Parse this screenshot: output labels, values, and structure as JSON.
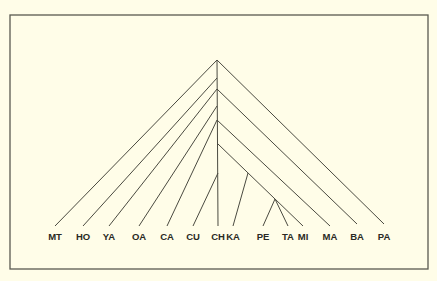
{
  "colors": {
    "background": "#fffde8",
    "line": "#4a4a40",
    "frame": "#5a5a50",
    "text": "#2a2a24"
  },
  "frame": {
    "x": 10,
    "y": 15,
    "width": 418,
    "height": 254
  },
  "tree": {
    "root": {
      "x": 217,
      "y": 60
    },
    "leaves": [
      {
        "id": "MT",
        "label": "MT",
        "x": 55,
        "y": 226
      },
      {
        "id": "HO",
        "label": "HO",
        "x": 83,
        "y": 226
      },
      {
        "id": "YA",
        "label": "YA",
        "x": 109,
        "y": 226
      },
      {
        "id": "OA",
        "label": "OA",
        "x": 139,
        "y": 226
      },
      {
        "id": "CA",
        "label": "CA",
        "x": 167,
        "y": 226
      },
      {
        "id": "CU",
        "label": "CU",
        "x": 193,
        "y": 226
      },
      {
        "id": "CH",
        "label": "CH",
        "x": 218,
        "y": 226
      },
      {
        "id": "KA",
        "label": "KA",
        "x": 233,
        "y": 226
      },
      {
        "id": "PE",
        "label": "PE",
        "x": 263,
        "y": 226
      },
      {
        "id": "TA",
        "label": "TA",
        "x": 288,
        "y": 226
      },
      {
        "id": "MI",
        "label": "MI",
        "x": 303,
        "y": 226
      },
      {
        "id": "MA",
        "label": "MA",
        "x": 330,
        "y": 226
      },
      {
        "id": "BA",
        "label": "BA",
        "x": 357,
        "y": 224
      },
      {
        "id": "PA",
        "label": "PA",
        "x": 384,
        "y": 224
      }
    ],
    "edges": [
      {
        "x1": 217,
        "y1": 60,
        "x2": 55,
        "y2": 226
      },
      {
        "x1": 217,
        "y1": 60,
        "x2": 384,
        "y2": 224
      },
      {
        "x1": 217,
        "y1": 78,
        "x2": 83,
        "y2": 226
      },
      {
        "x1": 217,
        "y1": 89,
        "x2": 109,
        "y2": 226
      },
      {
        "x1": 217,
        "y1": 89,
        "x2": 357,
        "y2": 224
      },
      {
        "x1": 217,
        "y1": 106,
        "x2": 139,
        "y2": 226
      },
      {
        "x1": 217,
        "y1": 120,
        "x2": 167,
        "y2": 226
      },
      {
        "x1": 217,
        "y1": 120,
        "x2": 330,
        "y2": 226
      },
      {
        "x1": 218,
        "y1": 144,
        "x2": 303,
        "y2": 226
      },
      {
        "x1": 218,
        "y1": 173,
        "x2": 193,
        "y2": 226
      },
      {
        "x1": 248,
        "y1": 173,
        "x2": 233,
        "y2": 226
      },
      {
        "x1": 275,
        "y1": 199,
        "x2": 263,
        "y2": 226
      },
      {
        "x1": 275,
        "y1": 199,
        "x2": 288,
        "y2": 226
      },
      {
        "x1": 217,
        "y1": 60,
        "x2": 218,
        "y2": 226
      }
    ]
  }
}
